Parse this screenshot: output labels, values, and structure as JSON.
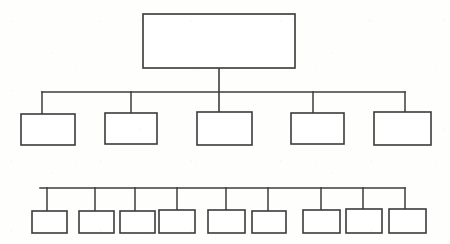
{
  "document": {
    "title": "Organization Chart",
    "kind": "hierarchy-tree-diagram",
    "canvas_width": 450,
    "canvas_height": 244,
    "background_color": "#fefefd",
    "line_color": "#3d3d3d",
    "box_fill_color": "#ffffff",
    "notes": "Blank organizational chart template: all node boxes are empty with no text labels."
  },
  "chart_data": {
    "type": "diagram",
    "subtype": "org-chart",
    "title": "",
    "levels": 3,
    "total_nodes": 15,
    "nodes_per_level": [
      1,
      5,
      9
    ],
    "labels_present": false,
    "level_1": {
      "name": "root-level",
      "count": 1,
      "bus_line": null,
      "nodes": [
        {
          "id": "root",
          "label": "",
          "x": 143,
          "y": 14,
          "w": 152,
          "h": 54
        }
      ]
    },
    "level_2": {
      "name": "second-level",
      "count": 5,
      "bus_line": {
        "y": 92,
        "x1": 42,
        "x2": 405
      },
      "nodes": [
        {
          "id": "n2-1",
          "label": "",
          "x": 21,
          "y": 114,
          "w": 54,
          "h": 31,
          "stub_x": 42
        },
        {
          "id": "n2-2",
          "label": "",
          "x": 105,
          "y": 113,
          "w": 52,
          "h": 31,
          "stub_x": 131
        },
        {
          "id": "n2-3",
          "label": "",
          "x": 197,
          "y": 112,
          "w": 55,
          "h": 33,
          "stub_x": 219
        },
        {
          "id": "n2-4",
          "label": "",
          "x": 291,
          "y": 113,
          "w": 53,
          "h": 31,
          "stub_x": 313
        },
        {
          "id": "n2-5",
          "label": "",
          "x": 374,
          "y": 112,
          "w": 57,
          "h": 33,
          "stub_x": 405
        }
      ]
    },
    "level_3": {
      "name": "third-level",
      "count": 9,
      "bus_line": {
        "y": 188,
        "x1": 40,
        "x2": 405
      },
      "nodes": [
        {
          "id": "n3-1",
          "label": "",
          "x": 32,
          "y": 211,
          "w": 35,
          "h": 22,
          "stub_x": 47
        },
        {
          "id": "n3-2",
          "label": "",
          "x": 79,
          "y": 211,
          "w": 35,
          "h": 22,
          "stub_x": 95
        },
        {
          "id": "n3-3",
          "label": "",
          "x": 120,
          "y": 211,
          "w": 35,
          "h": 22,
          "stub_x": 135
        },
        {
          "id": "n3-4",
          "label": "",
          "x": 159,
          "y": 210,
          "w": 36,
          "h": 23,
          "stub_x": 177
        },
        {
          "id": "n3-5",
          "label": "",
          "x": 208,
          "y": 210,
          "w": 37,
          "h": 23,
          "stub_x": 226
        },
        {
          "id": "n3-6",
          "label": "",
          "x": 252,
          "y": 211,
          "w": 34,
          "h": 22,
          "stub_x": 268
        },
        {
          "id": "n3-7",
          "label": "",
          "x": 303,
          "y": 210,
          "w": 37,
          "h": 23,
          "stub_x": 321
        },
        {
          "id": "n3-8",
          "label": "",
          "x": 346,
          "y": 209,
          "w": 36,
          "h": 24,
          "stub_x": 363
        },
        {
          "id": "n3-9",
          "label": "",
          "x": 389,
          "y": 209,
          "w": 37,
          "h": 24,
          "stub_x": 405
        }
      ]
    },
    "trunk": {
      "x": 219,
      "y1": 68,
      "y2": 112
    }
  }
}
